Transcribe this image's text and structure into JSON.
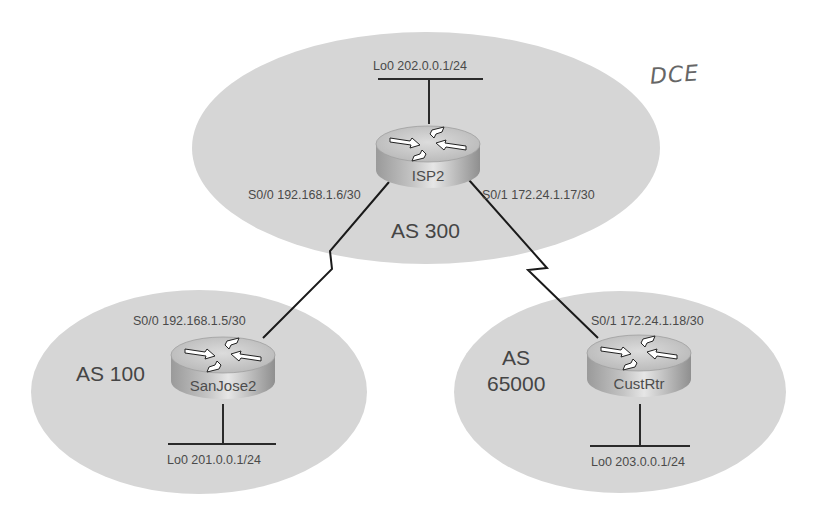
{
  "diagram": {
    "type": "network-topology",
    "annotation": "DCE",
    "colors": {
      "as_region_fill": "#d6d6d6",
      "link": "#1a1a1a",
      "router_top": "#cfcfcf",
      "router_side": "#a9a9a9",
      "text": "#4a4a4a"
    },
    "autonomous_systems": [
      {
        "id": "as300",
        "label": "AS 300"
      },
      {
        "id": "as100",
        "label": "AS 100"
      },
      {
        "id": "as65000",
        "label_line1": "AS",
        "label_line2": "65000"
      }
    ],
    "routers": [
      {
        "id": "isp2",
        "name": "ISP2",
        "as": "AS 300"
      },
      {
        "id": "sanjose2",
        "name": "SanJose2",
        "as": "AS 100"
      },
      {
        "id": "custrtr",
        "name": "CustRtr",
        "as": "AS 65000"
      }
    ],
    "interfaces": {
      "isp2_lo0": "Lo0 202.0.0.1/24",
      "isp2_s00": "S0/0 192.168.1.6/30",
      "isp2_s01": "S0/1 172.24.1.17/30",
      "sanjose2_s00": "S0/0 192.168.1.5/30",
      "sanjose2_lo0": "Lo0 201.0.0.1/24",
      "custrtr_s01": "S0/1 172.24.1.18/30",
      "custrtr_lo0": "Lo0 203.0.0.1/24"
    },
    "links": [
      {
        "from": "ISP2 S0/0",
        "to": "SanJose2 S0/0",
        "type": "serial",
        "subnet": "192.168.1.4/30"
      },
      {
        "from": "ISP2 S0/1",
        "to": "CustRtr S0/1",
        "type": "serial",
        "subnet": "172.24.1.16/30"
      }
    ]
  }
}
